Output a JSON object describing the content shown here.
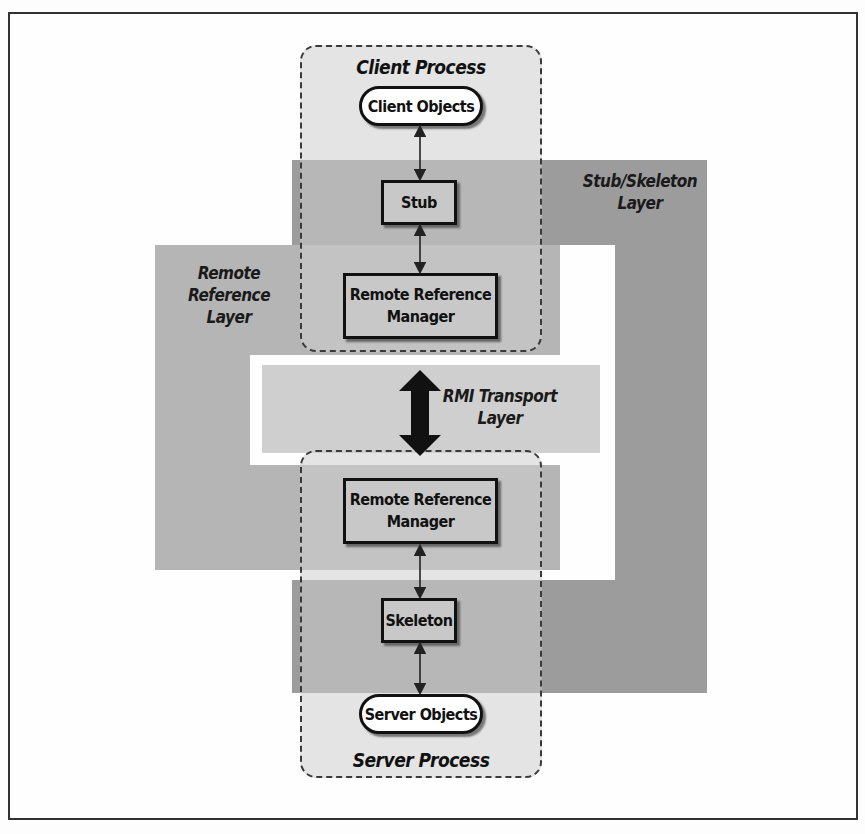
{
  "diagram": {
    "processes": {
      "client": {
        "label": "Client Process",
        "objects_label": "Client Objects"
      },
      "server": {
        "label": "Server Process",
        "objects_label": "Server Objects"
      }
    },
    "layers": {
      "stub_skeleton": {
        "line1": "Stub/Skeleton",
        "line2": "Layer"
      },
      "remote_reference": {
        "line1": "Remote Reference",
        "line2": "Layer"
      },
      "rmi_transport": {
        "line1": "RMI Transport",
        "line2": "Layer"
      }
    },
    "components": {
      "stub": "Stub",
      "client_rrm_line1": "Remote Reference",
      "client_rrm_line2": "Manager",
      "server_rrm_line1": "Remote Reference",
      "server_rrm_line2": "Manager",
      "skeleton": "Skeleton"
    },
    "connections": [
      {
        "from": "Client Objects",
        "to": "Stub",
        "style": "thin-bidirectional"
      },
      {
        "from": "Stub",
        "to": "Remote Reference Manager (client)",
        "style": "thin-bidirectional"
      },
      {
        "from": "Remote Reference Manager (client)",
        "to": "Remote Reference Manager (server)",
        "style": "thick-bidirectional"
      },
      {
        "from": "Remote Reference Manager (server)",
        "to": "Skeleton",
        "style": "thin-bidirectional"
      },
      {
        "from": "Skeleton",
        "to": "Server Objects",
        "style": "thin-bidirectional"
      }
    ],
    "colors": {
      "stub_skeleton_layer": "#9c9c9c",
      "remote_reference_layer": "#b5b5b5",
      "rmi_transport_layer": "#cfcfcf",
      "process_fill": "#cdcdcd",
      "outline": "#111111"
    }
  }
}
